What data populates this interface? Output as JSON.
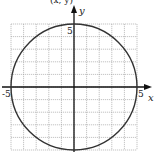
{
  "chart_data": {
    "type": "line",
    "title": "",
    "xlabel": "x",
    "ylabel": "y",
    "xlim": [
      -5,
      5
    ],
    "ylim": [
      -5,
      5
    ],
    "grid": true,
    "grid_step": 1,
    "tick_labels": {
      "x": [
        "-5",
        "5"
      ],
      "y": [
        "5"
      ]
    },
    "series": [
      {
        "name": "circle x^2 + y^2 = 25",
        "shape": "circle",
        "center": [
          0,
          0
        ],
        "radius": 5
      }
    ],
    "colors": {
      "grid": "#9a9a9a",
      "axes": "#111111",
      "curve": "#333333"
    }
  },
  "labels": {
    "x_axis": "x",
    "y_axis": "y",
    "x_min": "-5",
    "x_max": "5",
    "y_max": "5",
    "top_cut_text": "(x, y)"
  }
}
